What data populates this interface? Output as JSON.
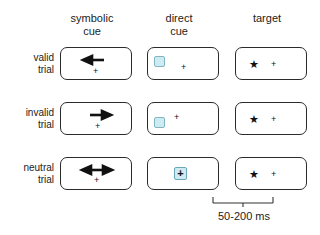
{
  "figure": {
    "columns": [
      {
        "id": "symbolic-cue",
        "label": "symbolic\ncue"
      },
      {
        "id": "direct-cue",
        "label": "direct\ncue"
      },
      {
        "id": "target",
        "label": "target"
      }
    ],
    "rows": [
      {
        "id": "valid",
        "label": "valid\ntrial"
      },
      {
        "id": "invalid",
        "label": "invalid\ntrial"
      },
      {
        "id": "neutral",
        "label": "neutral\ntrial"
      }
    ],
    "cells": {
      "valid": {
        "symbolic_cue": {
          "icon": "arrow-left-icon",
          "fixation": "+"
        },
        "direct_cue": {
          "icon": "cue-square-left-icon",
          "fixation": "+"
        },
        "target": {
          "icon": "star-left-icon",
          "star": "★",
          "fixation": "+"
        }
      },
      "invalid": {
        "symbolic_cue": {
          "icon": "arrow-right-icon",
          "fixation": "+"
        },
        "direct_cue": {
          "icon": "cue-square-left-icon",
          "fixation": "+"
        },
        "target": {
          "icon": "star-left-icon",
          "star": "★",
          "fixation": "+"
        }
      },
      "neutral": {
        "symbolic_cue": {
          "icon": "arrow-double-icon",
          "fixation": "+"
        },
        "direct_cue": {
          "icon": "cue-square-center-icon",
          "fixation": "+"
        },
        "target": {
          "icon": "star-left-icon",
          "star": "★",
          "fixation": "+"
        }
      }
    },
    "timing": {
      "label": "50-200 ms",
      "bracket_name": "soa-bracket"
    },
    "colors": {
      "box_border": "#2b2b2b",
      "cue_fill": "#cfeaf1",
      "cue_border": "#7fb6c4",
      "text": "#222222",
      "background": "#ffffff"
    }
  }
}
